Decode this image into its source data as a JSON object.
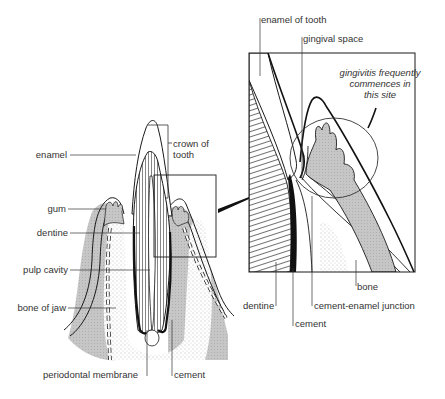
{
  "diagram": {
    "type": "anatomical-cross-section",
    "colors": {
      "line": "#1a1a1a",
      "bone_gray": "#c8c8c8",
      "stipple": "#e2e2e2",
      "background": "#ffffff",
      "label_text": "#333333"
    },
    "main_view": {
      "labels_left": [
        {
          "id": "enamel",
          "text": "enamel"
        },
        {
          "id": "gum",
          "text": "gum"
        },
        {
          "id": "dentine",
          "text": "dentine"
        },
        {
          "id": "pulp_cavity",
          "text": "pulp cavity"
        },
        {
          "id": "bone_of_jaw",
          "text": "bone of jaw"
        }
      ],
      "label_crown": {
        "line1": "crown of",
        "line2": "tooth"
      },
      "labels_bottom": [
        {
          "id": "periodontal_membrane",
          "text": "periodontal membrane"
        },
        {
          "id": "cement",
          "text": "cement"
        }
      ]
    },
    "inset_view": {
      "labels_top": [
        {
          "id": "enamel_of_tooth",
          "text": "enamel of tooth"
        },
        {
          "id": "gingival_space",
          "text": "gingival space"
        }
      ],
      "annotation": {
        "line1": "gingivitis frequently",
        "line2": "commences in",
        "line3": "this site"
      },
      "labels_bottom": [
        {
          "id": "bone",
          "text": "bone"
        },
        {
          "id": "dentine",
          "text": "dentine"
        },
        {
          "id": "cement_enamel_junction",
          "text": "cement-enamel junction"
        },
        {
          "id": "cement",
          "text": "cement"
        }
      ]
    }
  }
}
